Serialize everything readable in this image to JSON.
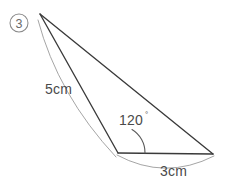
{
  "figure": {
    "item_number": "3",
    "background_color": "#ffffff",
    "line_color": "#3a3a3a",
    "arc_color": "#8e8e8e",
    "text_color": "#4a4a4a",
    "labels": {
      "side_a": "5cm",
      "side_b": "3cm",
      "angle": "120",
      "angle_unit": "°",
      "angle_full": "120°"
    },
    "vertices": {
      "apex": {
        "x": 40,
        "y": 14
      },
      "angle_vertex": {
        "x": 118,
        "y": 153
      },
      "right_vertex": {
        "x": 213,
        "y": 154
      }
    },
    "geometry": {
      "type": "triangle",
      "known_side_1": {
        "label": "5cm",
        "length": 5,
        "unit": "cm",
        "from": "apex",
        "to": "angle_vertex"
      },
      "known_side_2": {
        "label": "3cm",
        "length": 3,
        "unit": "cm",
        "from": "angle_vertex",
        "to": "right_vertex"
      },
      "included_angle": {
        "label": "120°",
        "degrees": 120,
        "at": "angle_vertex"
      }
    }
  }
}
